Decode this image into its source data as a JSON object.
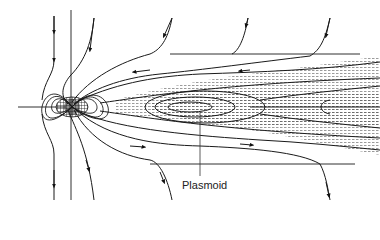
{
  "diagram": {
    "type": "magnetotail field-line schematic",
    "labels": {
      "plasmoid": "Plasmoid"
    },
    "colors": {
      "line": "#1a1a1a",
      "background": "#ffffff",
      "shade": "#555555"
    },
    "elements": [
      "planet (hatched dipole core)",
      "vertical reference line",
      "horizontal reference line (axis)",
      "upper and lower boundary lines",
      "inflowing lobe field lines with arrows",
      "closed plasmoid loops (dashed/dotted shading)",
      "tailward outflow field lines"
    ]
  }
}
